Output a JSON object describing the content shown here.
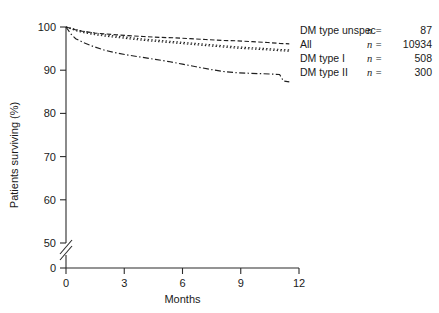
{
  "chart_data": {
    "type": "line",
    "title": "",
    "xlabel": "Months",
    "ylabel": "Patients surviving (%)",
    "xlim": [
      0,
      12
    ],
    "ylim": [
      45,
      101
    ],
    "xticks": [
      0,
      3,
      6,
      9,
      12
    ],
    "yticks": [
      50,
      60,
      70,
      80,
      90,
      100
    ],
    "y_axis_break": true,
    "y_break_label": "0",
    "grid": false,
    "legend_position": "right",
    "series": [
      {
        "name": "DM type unspec",
        "n_symbol": "n =",
        "n_value": "87",
        "linestyle": "dashed",
        "x": [
          0,
          0.3,
          0.6,
          1.0,
          1.5,
          2.0,
          2.6,
          3.2,
          4.0,
          4.8,
          5.6,
          6.4,
          7.2,
          8.0,
          8.8,
          9.6,
          10.4,
          11.0,
          11.5
        ],
        "y": [
          100,
          99.6,
          99.2,
          98.9,
          98.6,
          98.4,
          98.2,
          98.0,
          97.8,
          97.6,
          97.5,
          97.3,
          97.1,
          96.9,
          96.8,
          96.6,
          96.4,
          96.2,
          96.1
        ]
      },
      {
        "name": "All",
        "n_symbol": "n =",
        "n_value": "10934",
        "linestyle": "dotted",
        "x": [
          0,
          0.3,
          0.6,
          1.0,
          1.5,
          2.0,
          2.6,
          3.2,
          4.0,
          4.8,
          5.6,
          6.4,
          7.2,
          8.0,
          8.8,
          9.6,
          10.4,
          11.0,
          11.5
        ],
        "y": [
          100,
          99.7,
          99.3,
          98.9,
          98.5,
          98.2,
          97.9,
          97.6,
          97.2,
          96.9,
          96.6,
          96.3,
          96.0,
          95.7,
          95.4,
          95.2,
          95.0,
          94.8,
          94.7
        ]
      },
      {
        "name": "DM type I",
        "n_symbol": "n =",
        "n_value": "508",
        "linestyle": "dotted",
        "x": [
          0,
          0.3,
          0.6,
          1.0,
          1.5,
          2.0,
          2.6,
          3.2,
          4.0,
          4.8,
          5.6,
          6.4,
          7.2,
          8.0,
          8.8,
          9.6,
          10.4,
          11.0,
          11.5
        ],
        "y": [
          100,
          99.5,
          99.0,
          98.6,
          98.2,
          97.9,
          97.6,
          97.3,
          96.9,
          96.6,
          96.3,
          96.0,
          95.7,
          95.4,
          95.1,
          94.9,
          94.7,
          94.5,
          94.4
        ]
      },
      {
        "name": "DM type II",
        "n_symbol": "n =",
        "n_value": "300",
        "linestyle": "dashdot",
        "x": [
          0,
          0.25,
          0.5,
          0.9,
          1.4,
          2.0,
          2.6,
          3.2,
          3.9,
          4.6,
          5.3,
          6.0,
          6.7,
          7.4,
          8.1,
          8.8,
          9.4,
          10.0,
          10.6,
          11.0,
          11.2,
          11.5
        ],
        "y": [
          100,
          98.4,
          97.3,
          96.4,
          95.5,
          94.6,
          94.0,
          93.5,
          93.0,
          92.5,
          92.0,
          91.4,
          90.8,
          90.2,
          89.7,
          89.4,
          89.3,
          89.2,
          89.1,
          89.0,
          87.5,
          87.3
        ]
      }
    ]
  },
  "axis": {
    "y_title": "Patients surviving (%)",
    "x_title": "Months",
    "x_tick_labels": [
      "0",
      "3",
      "6",
      "9",
      "12"
    ],
    "y_tick_labels": [
      "50",
      "60",
      "70",
      "80",
      "90",
      "100"
    ],
    "y_zero_label": "0"
  },
  "legend": {
    "rows": [
      {
        "label": "DM type unspec",
        "n": "n =",
        "value": "87"
      },
      {
        "label": "All",
        "n": "n =",
        "value": "10934"
      },
      {
        "label": "DM type I",
        "n": "n =",
        "value": "508"
      },
      {
        "label": "DM type II",
        "n": "n =",
        "value": "300"
      }
    ]
  },
  "colors": {
    "ink": "#1f1f1f",
    "background": "#ffffff"
  }
}
